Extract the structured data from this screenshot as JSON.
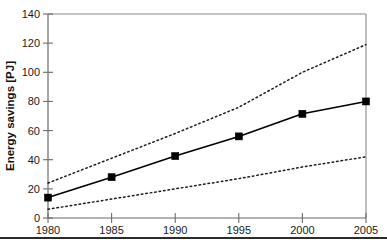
{
  "chart_data": {
    "type": "line",
    "title": "",
    "xlabel": "",
    "ylabel": "Energy savings [PJ]",
    "x": [
      1980,
      1985,
      1990,
      1995,
      2000,
      2005
    ],
    "xtick_labels": [
      "1980",
      "1985",
      "1990",
      "1995",
      "2000",
      "2005"
    ],
    "ytick_labels": [
      "0",
      "20",
      "40",
      "60",
      "80",
      "100",
      "120",
      "140"
    ],
    "yticks": [
      0,
      20,
      40,
      60,
      80,
      100,
      120,
      140
    ],
    "xlim": [
      1980,
      2005
    ],
    "ylim": [
      0,
      140
    ],
    "grid": false,
    "legend": "none",
    "series": [
      {
        "name": "Central estimate",
        "style": "solid-with-square-markers",
        "color": "#000000",
        "markers": true,
        "values": [
          14,
          28,
          42.5,
          56,
          71.5,
          80
        ]
      },
      {
        "name": "Upper bound",
        "style": "dotted",
        "color": "#1c1c1c",
        "markers": false,
        "values": [
          24,
          41,
          58,
          76,
          100,
          119
        ]
      },
      {
        "name": "Lower bound",
        "style": "dotted",
        "color": "#1c1c1c",
        "markers": false,
        "values": [
          6,
          13,
          20,
          27,
          35,
          42
        ]
      }
    ]
  },
  "axis": {
    "y_title": "Energy savings [PJ]",
    "y_ticks": [
      "140",
      "120",
      "100",
      "80",
      "60",
      "40",
      "20",
      "0"
    ],
    "x_ticks": [
      "1980",
      "1985",
      "1990",
      "1995",
      "2000",
      "2005"
    ]
  }
}
